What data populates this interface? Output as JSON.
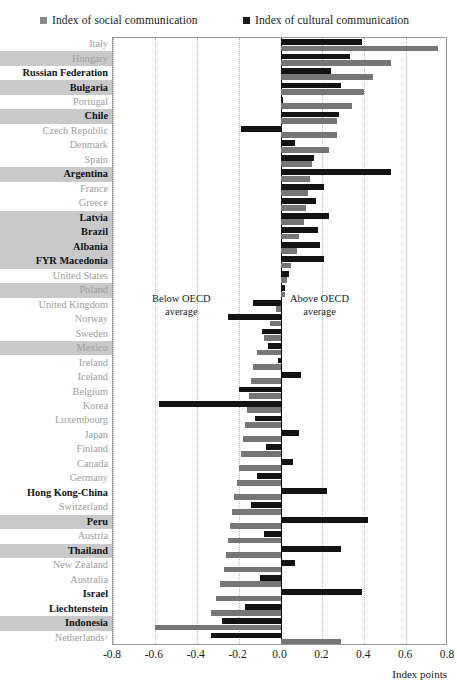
{
  "legend": {
    "social": {
      "label": "Index of social communication",
      "color": "#767676",
      "icon": "square-swatch"
    },
    "cultural": {
      "label": "Index of cultural communication",
      "color": "#131313",
      "icon": "square-swatch"
    }
  },
  "annotations": {
    "below": "Below OECD\naverage",
    "below_line1": "Below OECD",
    "below_line2": "average",
    "above_line1": "Above OECD",
    "above_line2": "average"
  },
  "axis": {
    "title": "Index points",
    "ticks": [
      "-0.8",
      "-0.6",
      "-0.4",
      "-0.2",
      "0.0",
      "0.2",
      "0.4",
      "0.6",
      "0.8"
    ]
  },
  "chart_data": {
    "type": "bar",
    "orientation": "horizontal",
    "title": "",
    "xlabel": "Index points",
    "ylabel": "",
    "xlim": [
      -0.8,
      0.8
    ],
    "xticks": [
      -0.8,
      -0.6,
      -0.4,
      -0.2,
      0.0,
      0.2,
      0.4,
      0.6,
      0.8
    ],
    "grid": "vertical-dotted",
    "legend_position": "top",
    "categories": [
      "Italy",
      "Hungary",
      "Russian Federation",
      "Bulgaria",
      "Portugal",
      "Chile",
      "Czech Republic",
      "Denmark",
      "Spain",
      "Argentina",
      "France",
      "Greece",
      "Latvia",
      "Brazil",
      "Albania",
      "FYR Macedonia",
      "United States",
      "Poland",
      "United Kingdom",
      "Norway",
      "Sweden",
      "Mexico",
      "Ireland",
      "Iceland",
      "Belgium",
      "Korea",
      "Luxembourg",
      "Japan",
      "Finland",
      "Canada",
      "Germany",
      "Hong Kong-China",
      "Switzerland",
      "Peru",
      "Austria",
      "Thailand",
      "New Zealand",
      "Australia",
      "Israel",
      "Liechtenstein",
      "Indonesia",
      "Netherlands"
    ],
    "series": [
      {
        "name": "Index of cultural communication",
        "color": "#131313",
        "values": [
          0.39,
          0.33,
          0.24,
          0.29,
          0.01,
          0.28,
          -0.19,
          0.07,
          0.16,
          0.53,
          0.21,
          0.17,
          0.23,
          0.18,
          0.19,
          0.21,
          0.04,
          0.02,
          -0.13,
          -0.25,
          -0.09,
          -0.06,
          -0.01,
          0.1,
          -0.2,
          -0.58,
          -0.12,
          0.09,
          -0.07,
          0.06,
          -0.11,
          0.22,
          -0.14,
          0.42,
          -0.08,
          0.29,
          0.07,
          -0.1,
          0.39,
          -0.17,
          -0.28,
          -0.33
        ]
      },
      {
        "name": "Index of social communication",
        "color": "#767676",
        "values": [
          0.75,
          0.53,
          0.44,
          0.4,
          0.34,
          0.27,
          0.27,
          0.23,
          0.15,
          0.14,
          0.13,
          0.12,
          0.11,
          0.09,
          0.08,
          0.05,
          0.03,
          0.02,
          -0.02,
          -0.05,
          -0.08,
          -0.11,
          -0.13,
          -0.14,
          -0.15,
          -0.16,
          -0.17,
          -0.18,
          -0.19,
          -0.2,
          -0.21,
          -0.22,
          -0.23,
          -0.24,
          -0.25,
          -0.26,
          -0.27,
          -0.29,
          -0.31,
          -0.33,
          -0.6,
          0.29
        ]
      }
    ],
    "label_styles": [
      {
        "country": "Italy",
        "emphasis": "dim",
        "band": false
      },
      {
        "country": "Hungary",
        "emphasis": "dim",
        "band": true
      },
      {
        "country": "Russian Federation",
        "emphasis": "bold",
        "band": false
      },
      {
        "country": "Bulgaria",
        "emphasis": "bold",
        "band": true
      },
      {
        "country": "Portugal",
        "emphasis": "dim",
        "band": false
      },
      {
        "country": "Chile",
        "emphasis": "bold",
        "band": true
      },
      {
        "country": "Czech Republic",
        "emphasis": "dim",
        "band": false
      },
      {
        "country": "Denmark",
        "emphasis": "dim",
        "band": false
      },
      {
        "country": "Spain",
        "emphasis": "dim",
        "band": false
      },
      {
        "country": "Argentina",
        "emphasis": "bold",
        "band": true
      },
      {
        "country": "France",
        "emphasis": "dim",
        "band": false
      },
      {
        "country": "Greece",
        "emphasis": "dim",
        "band": false
      },
      {
        "country": "Latvia",
        "emphasis": "bold",
        "band": true
      },
      {
        "country": "Brazil",
        "emphasis": "bold",
        "band": true
      },
      {
        "country": "Albania",
        "emphasis": "bold",
        "band": true
      },
      {
        "country": "FYR Macedonia",
        "emphasis": "bold",
        "band": true
      },
      {
        "country": "United States",
        "emphasis": "dim",
        "band": false
      },
      {
        "country": "Poland",
        "emphasis": "dim",
        "band": true
      },
      {
        "country": "United Kingdom",
        "emphasis": "dim",
        "band": false
      },
      {
        "country": "Norway",
        "emphasis": "dim",
        "band": false
      },
      {
        "country": "Sweden",
        "emphasis": "dim",
        "band": false
      },
      {
        "country": "Mexico",
        "emphasis": "dim",
        "band": true
      },
      {
        "country": "Ireland",
        "emphasis": "dim",
        "band": false
      },
      {
        "country": "Iceland",
        "emphasis": "dim",
        "band": false
      },
      {
        "country": "Belgium",
        "emphasis": "dim",
        "band": false
      },
      {
        "country": "Korea",
        "emphasis": "dim",
        "band": false
      },
      {
        "country": "Luxembourg",
        "emphasis": "dim",
        "band": false
      },
      {
        "country": "Japan",
        "emphasis": "dim",
        "band": false
      },
      {
        "country": "Finland",
        "emphasis": "dim",
        "band": false
      },
      {
        "country": "Canada",
        "emphasis": "dim",
        "band": false
      },
      {
        "country": "Germany",
        "emphasis": "dim",
        "band": false
      },
      {
        "country": "Hong Kong-China",
        "emphasis": "bold",
        "band": false
      },
      {
        "country": "Switzerland",
        "emphasis": "dim",
        "band": false
      },
      {
        "country": "Peru",
        "emphasis": "bold",
        "band": true
      },
      {
        "country": "Austria",
        "emphasis": "dim",
        "band": false
      },
      {
        "country": "Thailand",
        "emphasis": "bold",
        "band": true
      },
      {
        "country": "New Zealand",
        "emphasis": "dim",
        "band": false
      },
      {
        "country": "Australia",
        "emphasis": "dim",
        "band": false
      },
      {
        "country": "Israel",
        "emphasis": "bold",
        "band": false
      },
      {
        "country": "Liechtenstein",
        "emphasis": "bold",
        "band": false
      },
      {
        "country": "Indonesia",
        "emphasis": "bold",
        "band": true
      },
      {
        "country": "Netherlands",
        "emphasis": "dim",
        "band": false,
        "superscript": "1"
      }
    ]
  }
}
